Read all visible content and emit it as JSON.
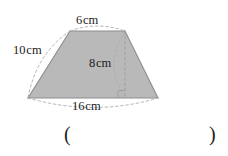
{
  "figure": {
    "name": "trapezoid-diagram",
    "shape": "trapezoid",
    "fill_color": "#b9b9b9",
    "stroke_color": "#8d8d8d",
    "dash_color": "#a8a8a8",
    "labels": {
      "top_edge": {
        "value": "6",
        "unit": "cm"
      },
      "left_edge": {
        "value": "10",
        "unit": "cm"
      },
      "height": {
        "value": "8",
        "unit": "cm"
      },
      "bottom_edge": {
        "value": "16",
        "unit": "cm"
      }
    },
    "markers": {
      "right_angle": "right-angle-marker"
    }
  },
  "answer": {
    "paren_open": "(",
    "paren_close": ")"
  }
}
